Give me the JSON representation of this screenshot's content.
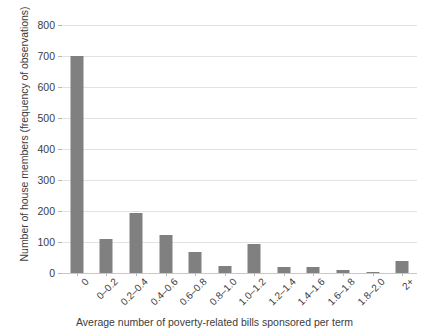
{
  "chart_data": {
    "type": "bar",
    "title": "",
    "xlabel": "Average number of poverty-related bills sponsored per term",
    "ylabel": "Number of house members (frequency of observations)",
    "categories": [
      "0",
      "0–0.2",
      "0.2–0.4",
      "0.4–0.6",
      "0.6–0.8",
      "0.8–1.0",
      "1.0–1.2",
      "1.2–1.4",
      "1.4–1.6",
      "1.6–1.8",
      "1.8–2.0",
      "2+"
    ],
    "values": [
      700,
      110,
      193,
      123,
      68,
      23,
      93,
      18,
      18,
      10,
      4,
      38
    ],
    "ylim": [
      0,
      800
    ],
    "yticks": [
      0,
      100,
      200,
      300,
      400,
      500,
      600,
      700,
      800
    ],
    "ytick_labels": [
      "0",
      "100",
      "200",
      "300",
      "400",
      "500",
      "600",
      "700",
      "800"
    ],
    "grid": true,
    "legend": null,
    "bar_color": "#808080",
    "grid_color": "#e2e2e2",
    "axis_color": "#c9c9c9",
    "background": "#ffffff"
  }
}
